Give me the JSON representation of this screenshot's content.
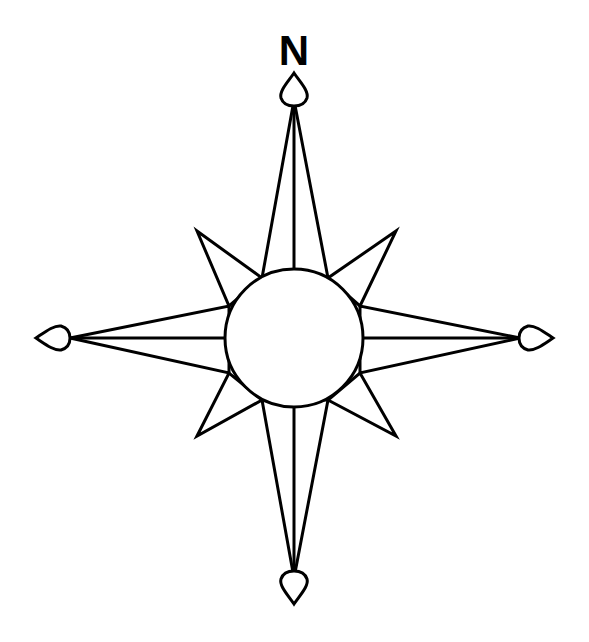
{
  "diagram": {
    "north_label": "N",
    "stroke_color": "#000000",
    "fill_color": "#ffffff",
    "center": [
      294,
      338
    ],
    "center_circle_radius": 69,
    "cardinal_points": [
      "north",
      "east",
      "south",
      "west"
    ],
    "intercardinal_points": [
      "northeast",
      "southeast",
      "southwest",
      "northwest"
    ]
  }
}
